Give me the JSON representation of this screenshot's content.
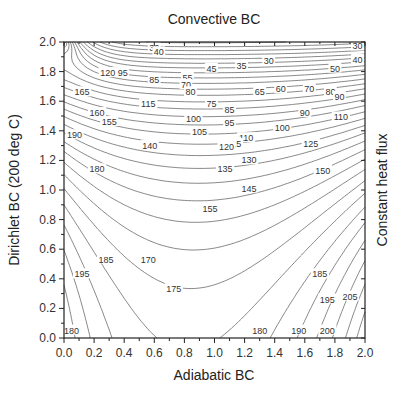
{
  "chart_data": {
    "type": "contour",
    "title": "Convective BC",
    "xlabel": "Adiabatic BC",
    "ylabel": "Dirichlet BC (200 deg C)",
    "right_label": "Constant heat flux",
    "xlim": [
      0.0,
      2.0
    ],
    "ylim": [
      0.0,
      2.0
    ],
    "x_ticks": [
      "0.0",
      "0.2",
      "0.4",
      "0.6",
      "0.8",
      "1.0",
      "1.2",
      "1.4",
      "1.6",
      "1.8",
      "2.0"
    ],
    "y_ticks": [
      "0.0",
      "0.2",
      "0.4",
      "0.6",
      "0.8",
      "1.0",
      "1.2",
      "1.4",
      "1.6",
      "1.8",
      "2.0"
    ],
    "grid": false,
    "contour_step": 5,
    "contour_range": [
      30,
      205
    ],
    "contour_labels": [
      {
        "value": "30",
        "x": 0.6,
        "y": 1.96
      },
      {
        "value": "40",
        "x": 0.63,
        "y": 1.93
      },
      {
        "value": "30",
        "x": 1.95,
        "y": 1.97
      },
      {
        "value": "40",
        "x": 1.95,
        "y": 1.88
      },
      {
        "value": "35",
        "x": 1.18,
        "y": 1.84
      },
      {
        "value": "30",
        "x": 1.36,
        "y": 1.87
      },
      {
        "value": "45",
        "x": 0.98,
        "y": 1.82
      },
      {
        "value": "50",
        "x": 1.8,
        "y": 1.82
      },
      {
        "value": "55",
        "x": 0.82,
        "y": 1.76
      },
      {
        "value": "120",
        "x": 0.29,
        "y": 1.79
      },
      {
        "value": "95",
        "x": 0.39,
        "y": 1.79
      },
      {
        "value": "85",
        "x": 0.6,
        "y": 1.74
      },
      {
        "value": "70",
        "x": 0.81,
        "y": 1.71
      },
      {
        "value": "80",
        "x": 0.84,
        "y": 1.66
      },
      {
        "value": "165",
        "x": 0.12,
        "y": 1.66
      },
      {
        "value": "65",
        "x": 1.3,
        "y": 1.66
      },
      {
        "value": "60",
        "x": 1.44,
        "y": 1.68
      },
      {
        "value": "70",
        "x": 1.63,
        "y": 1.68
      },
      {
        "value": "80",
        "x": 1.77,
        "y": 1.66
      },
      {
        "value": "90",
        "x": 1.83,
        "y": 1.63
      },
      {
        "value": "160",
        "x": 0.22,
        "y": 1.52
      },
      {
        "value": "115",
        "x": 0.56,
        "y": 1.58
      },
      {
        "value": "75",
        "x": 0.98,
        "y": 1.58
      },
      {
        "value": "85",
        "x": 1.1,
        "y": 1.54
      },
      {
        "value": "90",
        "x": 1.6,
        "y": 1.52
      },
      {
        "value": "110",
        "x": 1.84,
        "y": 1.49
      },
      {
        "value": "155",
        "x": 0.3,
        "y": 1.46
      },
      {
        "value": "100",
        "x": 0.86,
        "y": 1.48
      },
      {
        "value": "95",
        "x": 1.1,
        "y": 1.45
      },
      {
        "value": "105",
        "x": 0.9,
        "y": 1.39
      },
      {
        "value": "100",
        "x": 1.45,
        "y": 1.42
      },
      {
        "value": "110",
        "x": 1.21,
        "y": 1.35
      },
      {
        "value": "190",
        "x": 0.07,
        "y": 1.37
      },
      {
        "value": "115",
        "x": 1.13,
        "y": 1.31
      },
      {
        "value": "120",
        "x": 1.08,
        "y": 1.29
      },
      {
        "value": "125",
        "x": 1.64,
        "y": 1.31
      },
      {
        "value": "140",
        "x": 0.57,
        "y": 1.3
      },
      {
        "value": "130",
        "x": 1.23,
        "y": 1.2
      },
      {
        "value": "135",
        "x": 1.07,
        "y": 1.14
      },
      {
        "value": "150",
        "x": 1.72,
        "y": 1.13
      },
      {
        "value": "180",
        "x": 0.22,
        "y": 1.14
      },
      {
        "value": "145",
        "x": 1.23,
        "y": 1.01
      },
      {
        "value": "155",
        "x": 0.97,
        "y": 0.87
      },
      {
        "value": "185",
        "x": 0.28,
        "y": 0.53
      },
      {
        "value": "170",
        "x": 0.56,
        "y": 0.53
      },
      {
        "value": "175",
        "x": 0.73,
        "y": 0.33
      },
      {
        "value": "185",
        "x": 1.7,
        "y": 0.43
      },
      {
        "value": "195",
        "x": 0.12,
        "y": 0.43
      },
      {
        "value": "195",
        "x": 1.75,
        "y": 0.26
      },
      {
        "value": "205",
        "x": 1.9,
        "y": 0.28
      },
      {
        "value": "180",
        "x": 0.05,
        "y": 0.05
      },
      {
        "value": "180",
        "x": 1.3,
        "y": 0.05
      },
      {
        "value": "190",
        "x": 1.56,
        "y": 0.05
      },
      {
        "value": "200",
        "x": 1.75,
        "y": 0.05
      }
    ]
  },
  "colors": {
    "line": "#555555",
    "frame": "#222222",
    "background": "#ffffff"
  }
}
